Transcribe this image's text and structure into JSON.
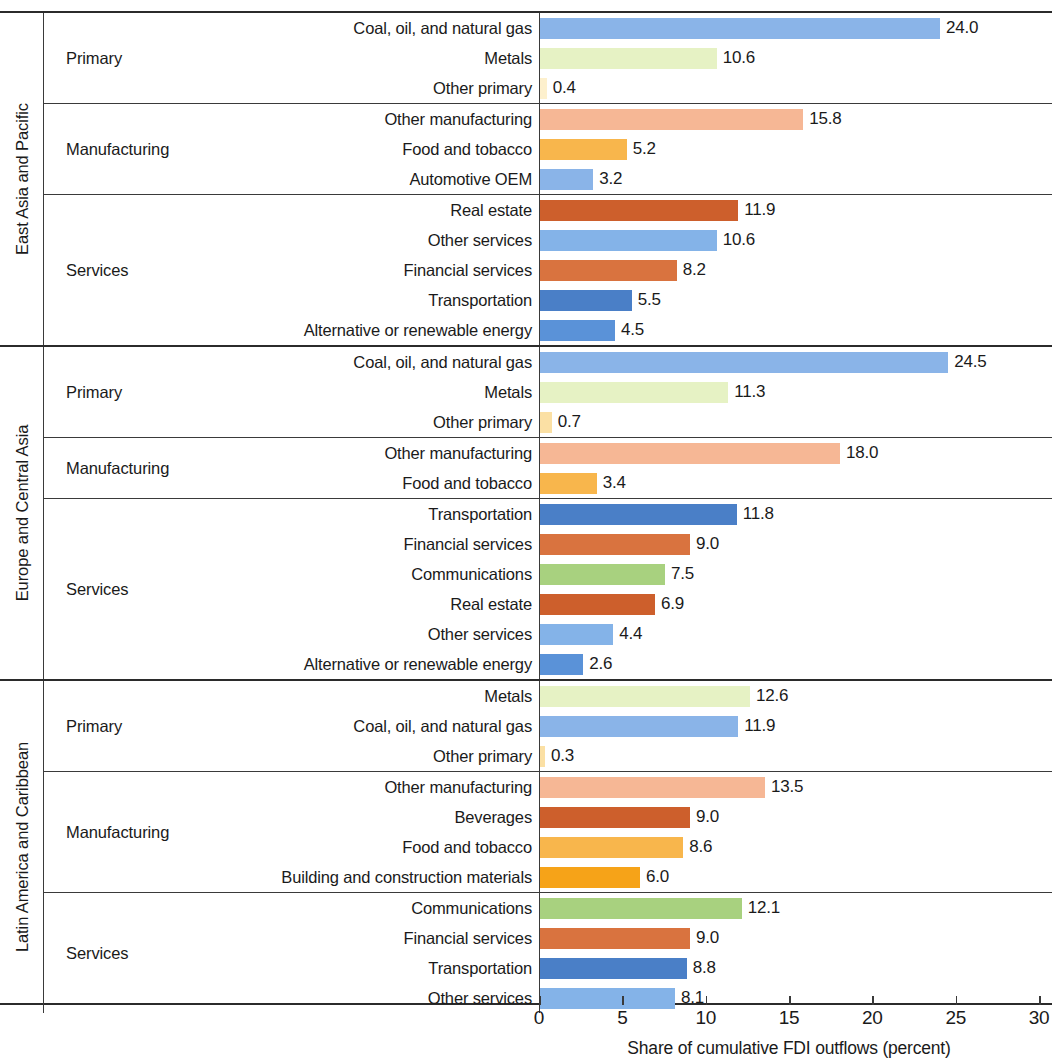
{
  "chart_data": {
    "type": "bar",
    "orientation": "horizontal",
    "title": "",
    "xlabel": "Share of cumulative FDI outflows (percent)",
    "ylabel": "",
    "xlim": [
      0,
      30
    ],
    "xticks": [
      0,
      5,
      10,
      15,
      20,
      25,
      30
    ],
    "xticklabels": [
      "0",
      "5",
      "10",
      "15",
      "20",
      "25",
      "30"
    ],
    "grid": false,
    "legend": "none",
    "value_label_format": "one decimal",
    "groups": [
      {
        "region": "East Asia and Pacific",
        "sectors": [
          {
            "sector": "Primary",
            "items": [
              {
                "label": "Coal, oil, and natural gas",
                "value": 24.0,
                "value_text": "24.0",
                "color": "#8ab4e8"
              },
              {
                "label": "Metals",
                "value": 10.6,
                "value_text": "10.6",
                "color": "#e6f2c4"
              },
              {
                "label": "Other primary",
                "value": 0.4,
                "value_text": "0.4",
                "color": "#fdf0cd"
              }
            ]
          },
          {
            "sector": "Manufacturing",
            "items": [
              {
                "label": "Other manufacturing",
                "value": 15.8,
                "value_text": "15.8",
                "color": "#f6b795"
              },
              {
                "label": "Food and tobacco",
                "value": 5.2,
                "value_text": "5.2",
                "color": "#f8b64c"
              },
              {
                "label": "Automotive OEM",
                "value": 3.2,
                "value_text": "3.2",
                "color": "#83c council"
              }
            ]
          },
          {
            "sector": "Services",
            "items": [
              {
                "label": "Real estate",
                "value": 11.9,
                "value_text": "11.9",
                "color": "#cd5f2c"
              },
              {
                "label": "Other services",
                "value": 10.6,
                "value_text": "10.6",
                "color": "#84b3e8"
              },
              {
                "label": "Financial services",
                "value": 8.2,
                "value_text": "8.2",
                "color": "#d9733f"
              },
              {
                "label": "Transportation",
                "value": 5.5,
                "value_text": "5.5",
                "color": "#4a7fc7"
              },
              {
                "label": "Alternative or renewable energy",
                "value": 4.5,
                "value_text": "4.5",
                "color": "#5a92d8"
              }
            ]
          }
        ]
      },
      {
        "region": "Europe and Central Asia",
        "sectors": [
          {
            "sector": "Primary",
            "items": [
              {
                "label": "Coal, oil, and natural gas",
                "value": 24.5,
                "value_text": "24.5",
                "color": "#8ab4e8"
              },
              {
                "label": "Metals",
                "value": 11.3,
                "value_text": "11.3",
                "color": "#e6f2c4"
              },
              {
                "label": "Other primary",
                "value": 0.7,
                "value_text": "0.7",
                "color": "#fbe0a4"
              }
            ]
          },
          {
            "sector": "Manufacturing",
            "items": [
              {
                "label": "Other manufacturing",
                "value": 18.0,
                "value_text": "18.0",
                "color": "#f6b795"
              },
              {
                "label": "Food and tobacco",
                "value": 3.4,
                "value_text": "3.4",
                "color": "#f8b64c"
              }
            ]
          },
          {
            "sector": "Services",
            "items": [
              {
                "label": "Transportation",
                "value": 11.8,
                "value_text": "11.8",
                "color": "#4a7fc7"
              },
              {
                "label": "Financial services",
                "value": 9.0,
                "value_text": "9.0",
                "color": "#d9733f"
              },
              {
                "label": "Communications",
                "value": 7.5,
                "value_text": "7.5",
                "color": "#a8d17f"
              },
              {
                "label": "Real estate",
                "value": 6.9,
                "value_text": "6.9",
                "color": "#cd5f2c"
              },
              {
                "label": "Other services",
                "value": 4.4,
                "value_text": "4.4",
                "color": "#84b3e8"
              },
              {
                "label": "Alternative or renewable energy",
                "value": 2.6,
                "value_text": "2.6",
                "color": "#5a92d8"
              }
            ]
          }
        ]
      },
      {
        "region": "Latin America and Caribbean",
        "sectors": [
          {
            "sector": "Primary",
            "items": [
              {
                "label": "Metals",
                "value": 12.6,
                "value_text": "12.6",
                "color": "#e6f2c4"
              },
              {
                "label": "Coal, oil, and natural gas",
                "value": 11.9,
                "value_text": "11.9",
                "color": "#8ab4e8"
              },
              {
                "label": "Other primary",
                "value": 0.3,
                "value_text": "0.3",
                "color": "#fbe0a4"
              }
            ]
          },
          {
            "sector": "Manufacturing",
            "items": [
              {
                "label": "Other manufacturing",
                "value": 13.5,
                "value_text": "13.5",
                "color": "#f6b795"
              },
              {
                "label": "Beverages",
                "value": 9.0,
                "value_text": "9.0",
                "color": "#cd5f2c"
              },
              {
                "label": "Food and tobacco",
                "value": 8.6,
                "value_text": "8.6",
                "color": "#f8b64c"
              },
              {
                "label": "Building and construction materials",
                "value": 6.0,
                "value_text": "6.0",
                "color": "#f6a318"
              }
            ]
          },
          {
            "sector": "Services",
            "items": [
              {
                "label": "Communications",
                "value": 12.1,
                "value_text": "12.1",
                "color": "#a8d17f"
              },
              {
                "label": "Financial services",
                "value": 9.0,
                "value_text": "9.0",
                "color": "#d9733f"
              },
              {
                "label": "Transportation",
                "value": 8.8,
                "value_text": "8.8",
                "color": "#4a7fc7"
              },
              {
                "label": "Other services",
                "value": 8.1,
                "value_text": "8.1",
                "color": "#84b3e8"
              }
            ]
          }
        ]
      }
    ]
  }
}
